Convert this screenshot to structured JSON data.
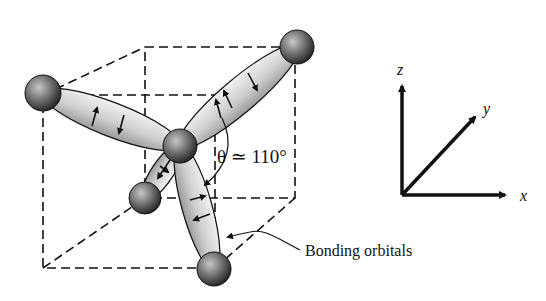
{
  "figure": {
    "angle_label": "θ ≃ 110°",
    "orbitals_label": "Bonding orbitals",
    "axes": {
      "x": "x",
      "y": "y",
      "z": "z"
    },
    "colors": {
      "ink": "#111111",
      "orbital_fill": "#d8d8d8",
      "atom_dark": "#2a2a2a",
      "atom_light": "#bdbdbd",
      "background": "#ffffff"
    }
  }
}
